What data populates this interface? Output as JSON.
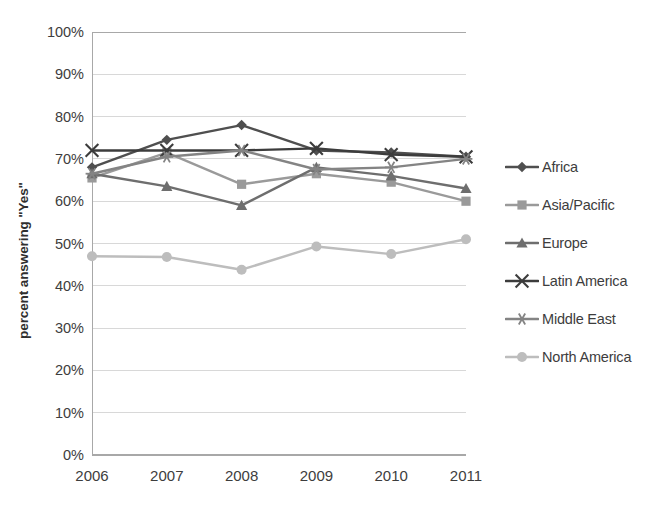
{
  "chart_data": {
    "type": "line",
    "title": "",
    "xlabel": "",
    "ylabel": "percent answering \"Yes\"",
    "categories": [
      "2006",
      "2007",
      "2008",
      "2009",
      "2010",
      "2011"
    ],
    "ylim": [
      0,
      100
    ],
    "ytick_labels": [
      "0%",
      "10%",
      "20%",
      "30%",
      "40%",
      "50%",
      "60%",
      "70%",
      "80%",
      "90%",
      "100%"
    ],
    "ytick_values": [
      0,
      10,
      20,
      30,
      40,
      50,
      60,
      70,
      80,
      90,
      100
    ],
    "grid": true,
    "grid_axis": "y",
    "legend_position": "right",
    "series": [
      {
        "name": "Africa",
        "marker": "diamond",
        "color": "#4f4f4f",
        "values": [
          68.0,
          74.5,
          78.0,
          72.0,
          71.5,
          70.5
        ]
      },
      {
        "name": "Asia/Pacific",
        "marker": "square",
        "color": "#9a9a9a",
        "values": [
          65.5,
          71.5,
          64.0,
          66.5,
          64.5,
          60.0
        ]
      },
      {
        "name": "Europe",
        "marker": "triangle",
        "color": "#6e6e6e",
        "values": [
          66.5,
          63.5,
          59.0,
          68.0,
          66.0,
          63.0
        ]
      },
      {
        "name": "Latin America",
        "marker": "x",
        "color": "#3c3c3c",
        "values": [
          72.0,
          72.0,
          72.0,
          72.5,
          71.0,
          70.5
        ]
      },
      {
        "name": "Middle East",
        "marker": "asterisk",
        "color": "#848484",
        "values": [
          66.5,
          70.5,
          72.0,
          67.5,
          68.0,
          70.0
        ]
      },
      {
        "name": "North America",
        "marker": "circle",
        "color": "#bdbdbd",
        "values": [
          47.0,
          46.8,
          43.8,
          49.3,
          47.5,
          51.0
        ]
      }
    ]
  },
  "axes": {
    "grid_color": "#d8d8d8",
    "axis_color": "#a8a8a8",
    "text_color": "#3d3d3d"
  }
}
